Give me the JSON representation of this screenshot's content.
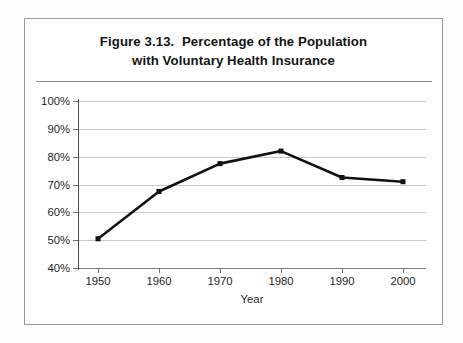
{
  "figure": {
    "title_line1": "Figure 3.13.  Percentage of the Population",
    "title_line2": "with Voluntary Health Insurance"
  },
  "chart_data": {
    "type": "line",
    "title": "Figure 3.13.  Percentage of the Population with Voluntary Health Insurance",
    "xlabel": "Year",
    "ylabel": "",
    "categories": [
      "1950",
      "1960",
      "1970",
      "1980",
      "1990",
      "2000"
    ],
    "x": [
      1950,
      1960,
      1970,
      1980,
      1990,
      2000
    ],
    "values": [
      50.5,
      67.5,
      77.5,
      82.0,
      72.5,
      71.0
    ],
    "series": [
      {
        "name": "Percentage of the population with voluntary health insurance",
        "values": [
          50.5,
          67.5,
          77.5,
          82.0,
          72.5,
          71.0
        ]
      }
    ],
    "ylim": [
      40,
      100
    ],
    "ytick_values": [
      40,
      50,
      60,
      70,
      80,
      90,
      100
    ],
    "ytick_labels": [
      "40%",
      "50%",
      "60%",
      "70%",
      "80%",
      "90%",
      "100%"
    ],
    "xtick_labels": [
      "1950",
      "1960",
      "1970",
      "1980",
      "1990",
      "2000"
    ],
    "grid": "horizontal",
    "legend": "none",
    "line_color": "#111111",
    "marker": "square"
  }
}
